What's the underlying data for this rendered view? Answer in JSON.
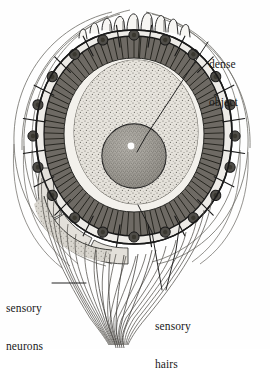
{
  "figure": {
    "kind": "biological-line-diagram",
    "background_color": "#fefefe",
    "ink_color": "#1a1a1a"
  },
  "labels": [
    {
      "id": "dense-object",
      "line1": "dense",
      "line2": "object",
      "x": 209,
      "y": 33,
      "leader": "diagonal line running down-left to the dark sphere"
    },
    {
      "id": "sensory-neurons",
      "line1": "sensory",
      "line2": "neurons",
      "x": 6,
      "y": 277,
      "leader": "horizontal dash pointing right into the nerve fiber bundle"
    },
    {
      "id": "sensory-hairs",
      "line1": "sensory",
      "line2": "hairs",
      "x": 155,
      "y": 295,
      "leader": "two lines forming a V up into the hair layer"
    }
  ],
  "structures": {
    "cell_ring": {
      "name": "epithelial cell ring",
      "cell_count": 20,
      "fill": "#edebe7",
      "stroke": "#1a1a1a",
      "nucleus_fill": "#555550",
      "nucleus_count": 20
    },
    "hair_layer": {
      "name": "sensory hair layer",
      "fill": "#6e6a64",
      "description": "dense radial striated band inside the cell ring"
    },
    "statolith_mass": {
      "name": "stippled central mass",
      "fill": "#dedbd4",
      "description": "ovoid stippled body filling the lumen"
    },
    "dense_object": {
      "name": "dense object sphere",
      "fill": "#a3a099",
      "stroke": "#1a1a1a",
      "highlight": "#ffffff",
      "cx": 134,
      "cy": 156,
      "r": 32
    },
    "nerve_bundle": {
      "name": "sensory neuron fiber bundle",
      "fiber_count": 26,
      "stroke": "#4a4a46",
      "description": "fibers sweep from the lower cell ring and converge to a tail"
    },
    "outer_contours": {
      "name": "outer capsule contour lines",
      "stroke": "#6a6862",
      "count": 6
    },
    "apical_hairs": {
      "name": "apical hair projections",
      "count": 9
    }
  },
  "colors": {
    "paper": "#fefefe",
    "ink": "#1a1a1a",
    "cell_fill": "#edebe7",
    "nucleus": "#555550",
    "hair_band": "#6e6a64",
    "stipple": "#dedbd4",
    "sphere": "#a3a099"
  }
}
